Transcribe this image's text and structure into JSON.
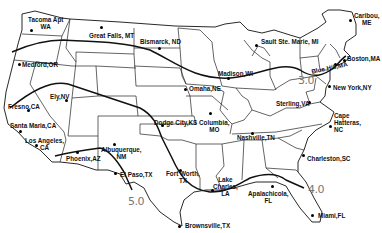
{
  "map": {
    "title": "",
    "isolines": [
      {
        "label": "3.0",
        "x": 298,
        "y": 81
      },
      {
        "label": "4.0",
        "x": 308,
        "y": 190
      },
      {
        "label": "5.0",
        "x": 128,
        "y": 201
      }
    ],
    "stations": [
      {
        "label": "Tacoma Apt\nWA",
        "x": 28,
        "y": 22,
        "dx": 31,
        "dy": 30
      },
      {
        "label": "Great Falls, MT",
        "x": 89,
        "y": 28,
        "dx": 101,
        "dy": 27
      },
      {
        "label": "Bismarck, ND",
        "x": 140,
        "y": 37,
        "dx": 159,
        "dy": 48
      },
      {
        "label": "Sault Ste. Marie, MI",
        "x": 261,
        "y": 39,
        "dx": 256,
        "dy": 45
      },
      {
        "label": "Caribou,\nME",
        "x": 353,
        "y": 15,
        "dx": 350,
        "dy": 20
      },
      {
        "label": "Boston,MA",
        "x": 346,
        "y": 56,
        "dx": 344,
        "dy": 60
      },
      {
        "label": "Blue Hill,MA",
        "x": 311,
        "y": 63,
        "dx": 335,
        "dy": 64
      },
      {
        "label": "Medford,OR",
        "x": 22,
        "y": 62,
        "dx": 19,
        "dy": 64
      },
      {
        "label": "Madison,WI",
        "x": 217,
        "y": 70,
        "dx": 228,
        "dy": 78
      },
      {
        "label": "New York,NY",
        "x": 333,
        "y": 84,
        "dx": 329,
        "dy": 86
      },
      {
        "label": "Omaha,NE",
        "x": 189,
        "y": 85,
        "dx": 185,
        "dy": 89
      },
      {
        "label": "Ely,NV",
        "x": 50,
        "y": 94,
        "dx": 66,
        "dy": 100
      },
      {
        "label": "Fresno,CA",
        "x": 8,
        "y": 104,
        "dx": 28,
        "dy": 110
      },
      {
        "label": "Sterling,VA",
        "x": 276,
        "y": 101,
        "dx": 309,
        "dy": 102
      },
      {
        "label": "Santa Maria,CA",
        "x": 10,
        "y": 123,
        "dx": 20,
        "dy": 131
      },
      {
        "label": "Dodge City,KS",
        "x": 154,
        "y": 120,
        "dx": 162,
        "dy": 125
      },
      {
        "label": "Columbia,\nMO",
        "x": 200,
        "y": 121,
        "dx": 210,
        "dy": 113
      },
      {
        "label": "Los Angeles,\nCA",
        "x": 25,
        "y": 137,
        "dx": 36,
        "dy": 145
      },
      {
        "label": "Nashville,TN",
        "x": 237,
        "y": 134,
        "dx": 252,
        "dy": 133
      },
      {
        "label": "Cape\nHatteras,\nNC",
        "x": 333,
        "y": 113,
        "dx": 330,
        "dy": 126
      },
      {
        "label": "Albuquerque,\nNM",
        "x": 101,
        "y": 147,
        "dx": 114,
        "dy": 144
      },
      {
        "label": "Phoenix,AZ",
        "x": 66,
        "y": 156,
        "dx": 77,
        "dy": 152
      },
      {
        "label": "Charleston,SC",
        "x": 306,
        "y": 154,
        "dx": 303,
        "dy": 155
      },
      {
        "label": "El Paso,TX",
        "x": 120,
        "y": 168,
        "dx": 115,
        "dy": 173
      },
      {
        "label": "Fort Worth,\nTX",
        "x": 166,
        "y": 170,
        "dx": 180,
        "dy": 170
      },
      {
        "label": "Lake\nCharles,\nLA",
        "x": 213,
        "y": 176,
        "dx": 212,
        "dy": 190
      },
      {
        "label": "Apalachicola,\nFL",
        "x": 247,
        "y": 190,
        "dx": 272,
        "dy": 186
      },
      {
        "label": "Miami,FL",
        "x": 318,
        "y": 213,
        "dx": 312,
        "dy": 215
      },
      {
        "label": "Brownsville,TX",
        "x": 185,
        "y": 222,
        "dx": 179,
        "dy": 226
      }
    ]
  }
}
